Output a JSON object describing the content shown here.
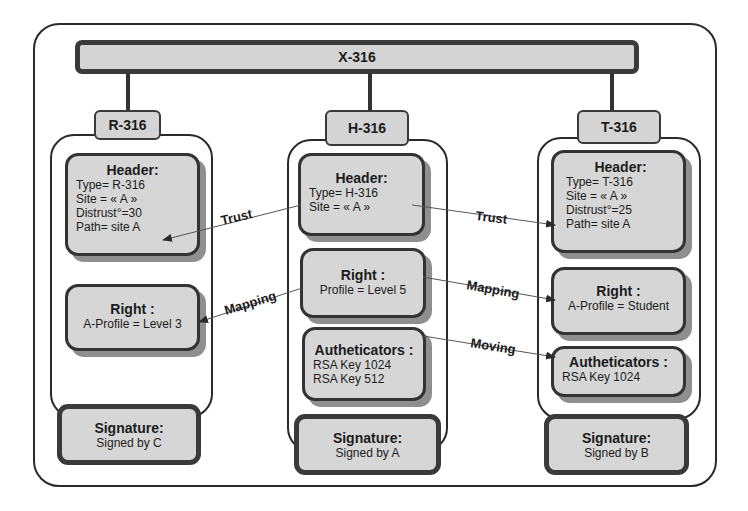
{
  "root": {
    "label": "X-316"
  },
  "columns": [
    {
      "id": "r",
      "tab": "R-316",
      "header": {
        "title": "Header:",
        "lines": [
          "Type= R-316",
          "Site = « A »",
          "Distrust°=30",
          "Path= site A"
        ]
      },
      "right": {
        "title": "Right :",
        "lines": [
          "A-Profile = Level 3"
        ]
      },
      "signature": {
        "title": "Signature:",
        "line": "Signed by C"
      }
    },
    {
      "id": "h",
      "tab": "H-316",
      "header": {
        "title": "Header:",
        "lines": [
          "Type= H-316",
          "Site = « A »"
        ]
      },
      "right": {
        "title": "Right :",
        "lines": [
          "Profile = Level 5"
        ]
      },
      "authenticators": {
        "title": "Autheticators :",
        "lines": [
          "RSA Key 1024",
          "RSA Key 512"
        ]
      },
      "signature": {
        "title": "Signature:",
        "line": "Signed by A"
      }
    },
    {
      "id": "t",
      "tab": "T-316",
      "header": {
        "title": "Header:",
        "lines": [
          "Type= T-316",
          "Site = « A »",
          "Distrust°=25",
          "Path= site A"
        ]
      },
      "right": {
        "title": "Right :",
        "lines": [
          "A-Profile = Student"
        ]
      },
      "authenticators": {
        "title": "Autheticators :",
        "lines": [
          "RSA Key 1024"
        ]
      },
      "signature": {
        "title": "Signature:",
        "line": "Signed by B"
      }
    }
  ],
  "arrows": [
    {
      "label": "Trust",
      "from": "H-316 Header",
      "to": "R-316 Header"
    },
    {
      "label": "Mapping",
      "from": "H-316 Right",
      "to": "R-316 Right"
    },
    {
      "label": "Trust",
      "from": "H-316 Header",
      "to": "T-316 Header"
    },
    {
      "label": "Mapping",
      "from": "H-316 Right",
      "to": "T-316 Right"
    },
    {
      "label": "Moving",
      "from": "H-316 Autheticators",
      "to": "T-316 Autheticators"
    }
  ],
  "colors": {
    "box_fill": "#d6d6d6",
    "border": "#333333",
    "shadow": "#8f8f8f"
  }
}
